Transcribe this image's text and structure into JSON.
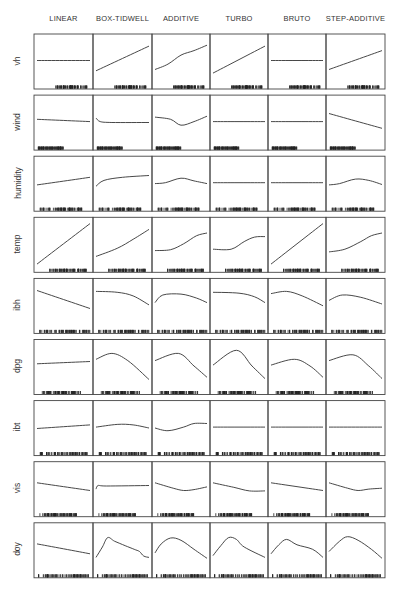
{
  "chart_data": {
    "type": "line",
    "title": "",
    "layout": "small-multiples grid (9 rows × 6 columns); each panel shows a fitted transformation curve with a rug of data ticks along the bottom",
    "columns": [
      "LINEAR",
      "BOX-TIDWELL",
      "ADDITIVE",
      "TURBO",
      "BRUTO",
      "STEP-ADDITIVE"
    ],
    "rows": [
      "vh",
      "wind",
      "humidity",
      "temp",
      "ibh",
      "dpg",
      "ibt",
      "vis",
      "doy"
    ],
    "axes": "no tick labels; each panel framed by box; y-scale shared across a row",
    "panels": {
      "vh": {
        "LINEAR": "flat",
        "BOX-TIDWELL": "increasing linear",
        "ADDITIVE": "increasing, slight S",
        "TURBO": "increasing linear",
        "BRUTO": "flat",
        "STEP-ADDITIVE": "increasing linear"
      },
      "wind": {
        "LINEAR": "slight decrease",
        "BOX-TIDWELL": "small drop then flat",
        "ADDITIVE": "dip in middle",
        "TURBO": "flat",
        "BRUTO": "flat",
        "STEP-ADDITIVE": "decreasing linear"
      },
      "humidity": {
        "LINEAR": "increasing linear",
        "BOX-TIDWELL": "concave increasing",
        "ADDITIVE": "gentle hump",
        "TURBO": "flat",
        "BRUTO": "flat",
        "STEP-ADDITIVE": "gentle hump"
      },
      "temp": {
        "LINEAR": "steep increasing linear",
        "BOX-TIDWELL": "convex increasing",
        "ADDITIVE": "S-shaped increasing",
        "TURBO": "S-shaped increasing",
        "BRUTO": "steep increasing linear",
        "STEP-ADDITIVE": "S-shaped increasing"
      },
      "ibh": {
        "LINEAR": "decreasing linear",
        "BOX-TIDWELL": "flat then decreasing",
        "ADDITIVE": "rise then decrease",
        "TURBO": "flat then decreasing",
        "BRUTO": "slight hump then decrease",
        "STEP-ADDITIVE": "hump then decrease"
      },
      "dpg": {
        "LINEAR": "slight increase",
        "BOX-TIDWELL": "hump then steep drop",
        "ADDITIVE": "hump then steep drop",
        "TURBO": "peak then steep drop",
        "BRUTO": "hump then drop",
        "STEP-ADDITIVE": "hump then steep drop"
      },
      "ibt": {
        "LINEAR": "slight increase",
        "BOX-TIDWELL": "gentle hump",
        "ADDITIVE": "dip then rise",
        "TURBO": "flat",
        "BRUTO": "flat",
        "STEP-ADDITIVE": "flat"
      },
      "vis": {
        "LINEAR": "decreasing linear",
        "BOX-TIDWELL": "jump then flat",
        "ADDITIVE": "decrease then slight rise",
        "TURBO": "decrease then flat",
        "BRUTO": "decreasing linear",
        "STEP-ADDITIVE": "decrease then slight rise"
      },
      "doy": {
        "LINEAR": "decreasing linear",
        "BOX-TIDWELL": "sharp peak, wiggly decline",
        "ADDITIVE": "peak then decline",
        "TURBO": "peak then decline",
        "BRUTO": "peak then wiggly decline",
        "STEP-ADDITIVE": "peak then decline"
      }
    },
    "curves": {
      "vh": [
        [
          [
            0,
            0.5
          ],
          [
            1,
            0.5
          ]
        ],
        [
          [
            0,
            0.27
          ],
          [
            1,
            0.82
          ]
        ],
        [
          [
            0,
            0.3
          ],
          [
            0.25,
            0.42
          ],
          [
            0.5,
            0.62
          ],
          [
            0.75,
            0.72
          ],
          [
            1,
            0.84
          ]
        ],
        [
          [
            0,
            0.22
          ],
          [
            1,
            0.82
          ]
        ],
        [
          [
            0,
            0.5
          ],
          [
            1,
            0.5
          ]
        ],
        [
          [
            0,
            0.3
          ],
          [
            1,
            0.72
          ]
        ]
      ],
      "wind": [
        [
          [
            0,
            0.55
          ],
          [
            1,
            0.5
          ]
        ],
        [
          [
            0,
            0.58
          ],
          [
            0.08,
            0.5
          ],
          [
            0.3,
            0.48
          ],
          [
            1,
            0.48
          ]
        ],
        [
          [
            0,
            0.6
          ],
          [
            0.3,
            0.55
          ],
          [
            0.5,
            0.42
          ],
          [
            0.75,
            0.5
          ],
          [
            1,
            0.62
          ]
        ],
        [
          [
            0,
            0.5
          ],
          [
            1,
            0.5
          ]
        ],
        [
          [
            0,
            0.5
          ],
          [
            1,
            0.5
          ]
        ],
        [
          [
            0,
            0.68
          ],
          [
            1,
            0.35
          ]
        ]
      ],
      "humidity": [
        [
          [
            0,
            0.45
          ],
          [
            1,
            0.62
          ]
        ],
        [
          [
            0,
            0.42
          ],
          [
            0.15,
            0.55
          ],
          [
            0.5,
            0.62
          ],
          [
            1,
            0.66
          ]
        ],
        [
          [
            0,
            0.48
          ],
          [
            0.2,
            0.5
          ],
          [
            0.5,
            0.6
          ],
          [
            0.75,
            0.54
          ],
          [
            1,
            0.48
          ]
        ],
        [
          [
            0,
            0.5
          ],
          [
            1,
            0.5
          ]
        ],
        [
          [
            0,
            0.5
          ],
          [
            1,
            0.5
          ]
        ],
        [
          [
            0,
            0.45
          ],
          [
            0.2,
            0.48
          ],
          [
            0.5,
            0.58
          ],
          [
            0.75,
            0.55
          ],
          [
            1,
            0.46
          ]
        ]
      ],
      "temp": [
        [
          [
            0,
            0.05
          ],
          [
            1,
            0.95
          ]
        ],
        [
          [
            0,
            0.22
          ],
          [
            0.4,
            0.4
          ],
          [
            0.7,
            0.6
          ],
          [
            1,
            0.82
          ]
        ],
        [
          [
            0,
            0.35
          ],
          [
            0.3,
            0.37
          ],
          [
            0.55,
            0.5
          ],
          [
            0.8,
            0.68
          ],
          [
            1,
            0.74
          ]
        ],
        [
          [
            0,
            0.38
          ],
          [
            0.35,
            0.38
          ],
          [
            0.6,
            0.55
          ],
          [
            0.8,
            0.65
          ],
          [
            1,
            0.66
          ]
        ],
        [
          [
            0,
            0.05
          ],
          [
            1,
            0.95
          ]
        ],
        [
          [
            0,
            0.32
          ],
          [
            0.3,
            0.38
          ],
          [
            0.6,
            0.55
          ],
          [
            0.8,
            0.68
          ],
          [
            1,
            0.74
          ]
        ]
      ],
      "ibh": [
        [
          [
            0,
            0.82
          ],
          [
            1,
            0.42
          ]
        ],
        [
          [
            0,
            0.8
          ],
          [
            0.4,
            0.78
          ],
          [
            0.7,
            0.7
          ],
          [
            1,
            0.5
          ]
        ],
        [
          [
            0,
            0.55
          ],
          [
            0.15,
            0.72
          ],
          [
            0.5,
            0.74
          ],
          [
            0.8,
            0.65
          ],
          [
            1,
            0.55
          ]
        ],
        [
          [
            0,
            0.78
          ],
          [
            0.5,
            0.76
          ],
          [
            0.8,
            0.68
          ],
          [
            1,
            0.55
          ]
        ],
        [
          [
            0,
            0.75
          ],
          [
            0.3,
            0.8
          ],
          [
            0.6,
            0.7
          ],
          [
            1,
            0.48
          ]
        ],
        [
          [
            0,
            0.6
          ],
          [
            0.25,
            0.72
          ],
          [
            0.6,
            0.67
          ],
          [
            1,
            0.52
          ]
        ]
      ],
      "dpg": [
        [
          [
            0,
            0.55
          ],
          [
            1,
            0.6
          ]
        ],
        [
          [
            0,
            0.65
          ],
          [
            0.3,
            0.78
          ],
          [
            0.6,
            0.62
          ],
          [
            1,
            0.2
          ]
        ],
        [
          [
            0,
            0.62
          ],
          [
            0.45,
            0.78
          ],
          [
            0.75,
            0.5
          ],
          [
            1,
            0.25
          ]
        ],
        [
          [
            0,
            0.52
          ],
          [
            0.45,
            0.85
          ],
          [
            0.75,
            0.5
          ],
          [
            1,
            0.22
          ]
        ],
        [
          [
            0,
            0.52
          ],
          [
            0.45,
            0.65
          ],
          [
            0.75,
            0.5
          ],
          [
            1,
            0.25
          ]
        ],
        [
          [
            0,
            0.62
          ],
          [
            0.45,
            0.75
          ],
          [
            0.75,
            0.5
          ],
          [
            1,
            0.22
          ]
        ]
      ],
      "ibt": [
        [
          [
            0,
            0.47
          ],
          [
            1,
            0.55
          ]
        ],
        [
          [
            0,
            0.5
          ],
          [
            0.4,
            0.56
          ],
          [
            0.7,
            0.55
          ],
          [
            1,
            0.48
          ]
        ],
        [
          [
            0,
            0.48
          ],
          [
            0.25,
            0.42
          ],
          [
            0.55,
            0.5
          ],
          [
            0.75,
            0.58
          ],
          [
            1,
            0.58
          ]
        ],
        [
          [
            0,
            0.5
          ],
          [
            1,
            0.5
          ]
        ],
        [
          [
            0,
            0.5
          ],
          [
            1,
            0.5
          ]
        ],
        [
          [
            0,
            0.5
          ],
          [
            1,
            0.5
          ]
        ]
      ],
      "vis": [
        [
          [
            0,
            0.62
          ],
          [
            1,
            0.45
          ]
        ],
        [
          [
            0,
            0.48
          ],
          [
            0.04,
            0.56
          ],
          [
            0.2,
            0.55
          ],
          [
            1,
            0.56
          ]
        ],
        [
          [
            0,
            0.62
          ],
          [
            0.35,
            0.5
          ],
          [
            0.55,
            0.45
          ],
          [
            0.75,
            0.47
          ],
          [
            1,
            0.53
          ]
        ],
        [
          [
            0,
            0.62
          ],
          [
            0.4,
            0.52
          ],
          [
            0.7,
            0.44
          ],
          [
            1,
            0.44
          ]
        ],
        [
          [
            0,
            0.62
          ],
          [
            1,
            0.45
          ]
        ],
        [
          [
            0,
            0.62
          ],
          [
            0.35,
            0.5
          ],
          [
            0.55,
            0.45
          ],
          [
            0.75,
            0.48
          ],
          [
            1,
            0.5
          ]
        ]
      ],
      "doy": [
        [
          [
            0,
            0.62
          ],
          [
            1,
            0.4
          ]
        ],
        [
          [
            0,
            0.32
          ],
          [
            0.12,
            0.55
          ],
          [
            0.22,
            0.76
          ],
          [
            0.35,
            0.68
          ],
          [
            0.55,
            0.58
          ],
          [
            0.72,
            0.5
          ],
          [
            0.82,
            0.45
          ],
          [
            0.9,
            0.35
          ],
          [
            1,
            0.32
          ]
        ],
        [
          [
            0,
            0.42
          ],
          [
            0.12,
            0.62
          ],
          [
            0.3,
            0.75
          ],
          [
            0.5,
            0.7
          ],
          [
            0.75,
            0.5
          ],
          [
            1,
            0.3
          ]
        ],
        [
          [
            0,
            0.36
          ],
          [
            0.15,
            0.58
          ],
          [
            0.3,
            0.76
          ],
          [
            0.45,
            0.72
          ],
          [
            0.6,
            0.55
          ],
          [
            1,
            0.32
          ]
        ],
        [
          [
            0,
            0.4
          ],
          [
            0.15,
            0.6
          ],
          [
            0.3,
            0.72
          ],
          [
            0.5,
            0.6
          ],
          [
            0.8,
            0.5
          ],
          [
            1,
            0.32
          ]
        ],
        [
          [
            0,
            0.45
          ],
          [
            0.2,
            0.68
          ],
          [
            0.35,
            0.78
          ],
          [
            0.55,
            0.7
          ],
          [
            0.8,
            0.5
          ],
          [
            1,
            0.3
          ]
        ]
      ]
    },
    "rug_extent": {
      "vh": [
        0.3,
        0.95
      ],
      "wind": [
        0.02,
        0.5
      ],
      "humidity": [
        0.02,
        0.85
      ],
      "temp": [
        0.2,
        0.95
      ],
      "ibh": [
        0.05,
        1.0
      ],
      "dpg": [
        0.1,
        0.85
      ],
      "ibt": [
        0.05,
        0.95
      ],
      "vis": [
        0.05,
        0.75
      ],
      "doy": [
        0.02,
        0.98
      ]
    },
    "grid": false,
    "legend": null
  }
}
